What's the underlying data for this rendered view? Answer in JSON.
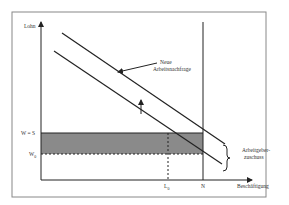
{
  "diagram": {
    "y_axis_label": "Lohn",
    "x_axis_label": "Beschäftigung",
    "curve_label_line1": "Neue",
    "curve_label_line2": "Arbeitsnachfrage",
    "wage_label": "W = S",
    "w0_label": "W",
    "w0_sub": "0",
    "l0_label": "L",
    "l0_sub": "0",
    "n_label": "N",
    "subsidy_label_line1": "Arbeitgeber-",
    "subsidy_label_line2": "zuschuss",
    "colors": {
      "frame": "#888888",
      "lines": "#222222",
      "shaded": "#8a8a8a"
    }
  }
}
